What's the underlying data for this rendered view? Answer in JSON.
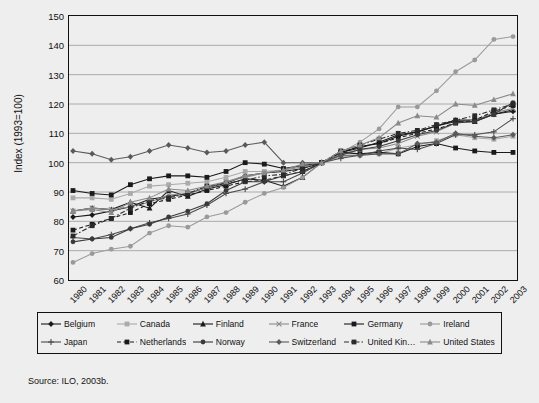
{
  "figure": {
    "source_note": "Source: ILO, 2003b.",
    "background": "#eeeeee",
    "frame_color": "#111111",
    "gridline_color": "#999999"
  },
  "axes": {
    "y_title": "Index (1993=100)",
    "y_ticks": [
      150,
      140,
      130,
      120,
      110,
      100,
      90,
      80,
      70,
      60
    ],
    "x_ticks": [
      "1980",
      "1981",
      "1982",
      "1983",
      "1984",
      "1985",
      "1986",
      "1987",
      "1988",
      "1989",
      "1990",
      "1991",
      "1992",
      "1993",
      "1994",
      "1995",
      "1996",
      "1997",
      "1998",
      "1999",
      "2000",
      "2001",
      "2002",
      "2003"
    ]
  },
  "legend": {
    "items": [
      {
        "label": "Belgium",
        "marker": "diamond",
        "dash": "solid",
        "color": "#1a1a1a"
      },
      {
        "label": "Canada",
        "marker": "square",
        "dash": "solid",
        "color": "#aaaaaa"
      },
      {
        "label": "Finland",
        "marker": "triangle",
        "dash": "solid",
        "color": "#1a1a1a"
      },
      {
        "label": "France",
        "marker": "x",
        "dash": "solid",
        "color": "#8a8a8a"
      },
      {
        "label": "Germany",
        "marker": "square",
        "dash": "solid",
        "color": "#1a1a1a"
      },
      {
        "label": "Ireland",
        "marker": "circle",
        "dash": "solid",
        "color": "#9a9a9a"
      },
      {
        "label": "Japan",
        "marker": "plus",
        "dash": "solid",
        "color": "#4a4a4a"
      },
      {
        "label": "Netherlands",
        "marker": "square",
        "dash": "dashed",
        "color": "#1a1a1a"
      },
      {
        "label": "Norway",
        "marker": "circle",
        "dash": "solid",
        "color": "#3a3a3a"
      },
      {
        "label": "Switzerland",
        "marker": "diamond",
        "dash": "solid",
        "color": "#5a5a5a"
      },
      {
        "label": "United Kingdom",
        "marker": "square",
        "dash": "dashdot",
        "color": "#2a2a2a"
      },
      {
        "label": "United States",
        "marker": "triangle",
        "dash": "solid",
        "color": "#8a8a8a"
      }
    ]
  },
  "chart_data": {
    "type": "line",
    "title": "",
    "xlabel": "",
    "ylabel": "Index (1993=100)",
    "ylim": [
      60,
      150
    ],
    "ytick_step": 10,
    "grid": "horizontal",
    "legend_position": "bottom",
    "x": [
      "1980",
      "1981",
      "1982",
      "1983",
      "1984",
      "1985",
      "1986",
      "1987",
      "1988",
      "1989",
      "1990",
      "1991",
      "1992",
      "1993",
      "1994",
      "1995",
      "1996",
      "1997",
      "1998",
      "1999",
      "2000",
      "2001",
      "2002",
      "2003"
    ],
    "series": [
      {
        "name": "Belgium",
        "values": [
          81.5,
          82.2,
          83.5,
          85.0,
          87.5,
          88.5,
          89.5,
          91.5,
          93.0,
          95.5,
          96.5,
          97.0,
          98.0,
          100,
          103.5,
          105.5,
          106.5,
          109.0,
          110.5,
          112.5,
          114.5,
          114.5,
          116.5,
          117.5
        ]
      },
      {
        "name": "Canada",
        "values": [
          88.0,
          88.0,
          87.5,
          89.5,
          92.0,
          92.5,
          93.0,
          93.5,
          95.0,
          97.0,
          97.0,
          97.5,
          99.0,
          100,
          102.0,
          102.5,
          103.0,
          105.0,
          106.0,
          107.5,
          109.5,
          108.5,
          108.0,
          109.0
        ]
      },
      {
        "name": "Finland",
        "values": [
          83.5,
          84.5,
          84.0,
          86.5,
          84.5,
          90.5,
          88.5,
          91.0,
          92.5,
          94.5,
          94.0,
          92.0,
          95.0,
          100,
          103.5,
          105.0,
          107.0,
          109.5,
          110.5,
          112.5,
          114.0,
          114.0,
          116.5,
          118.0
        ]
      },
      {
        "name": "France",
        "values": [
          83.5,
          84.5,
          84.0,
          85.0,
          86.5,
          89.0,
          89.5,
          91.5,
          93.5,
          95.0,
          96.5,
          97.5,
          98.5,
          100,
          103.0,
          104.5,
          105.0,
          106.5,
          109.0,
          110.5,
          113.5,
          114.5,
          117.0,
          118.5
        ]
      },
      {
        "name": "Germany",
        "values": [
          90.5,
          89.5,
          89.0,
          92.5,
          94.5,
          95.5,
          95.5,
          95.0,
          97.0,
          100.0,
          99.5,
          98.0,
          99.0,
          100,
          103.5,
          103.0,
          103.5,
          103.0,
          105.5,
          106.5,
          105.0,
          104.0,
          103.5,
          103.5
        ]
      },
      {
        "name": "Ireland",
        "values": [
          66.0,
          69.0,
          70.5,
          71.5,
          76.0,
          78.5,
          78.0,
          81.5,
          83.0,
          86.5,
          89.5,
          91.5,
          95.0,
          100,
          103.5,
          107.0,
          111.5,
          119.0,
          119.0,
          124.5,
          131.0,
          135.0,
          142.0,
          143.0
        ]
      },
      {
        "name": "Japan",
        "values": [
          74.5,
          74.0,
          75.5,
          77.5,
          79.5,
          81.0,
          82.5,
          85.5,
          89.5,
          91.0,
          93.5,
          93.5,
          96.5,
          100,
          101.5,
          102.5,
          104.0,
          105.0,
          104.5,
          106.5,
          109.5,
          109.5,
          110.5,
          115.0
        ]
      },
      {
        "name": "Netherlands",
        "values": [
          77.0,
          79.0,
          81.0,
          83.0,
          86.0,
          87.5,
          89.0,
          90.5,
          92.0,
          93.5,
          94.0,
          95.5,
          97.0,
          100,
          103.5,
          105.5,
          106.5,
          108.5,
          110.0,
          111.5,
          113.5,
          114.5,
          117.5,
          119.5
        ]
      },
      {
        "name": "Norway",
        "values": [
          73.0,
          74.0,
          74.5,
          77.5,
          79.0,
          81.5,
          83.5,
          86.0,
          90.5,
          93.5,
          93.5,
          95.5,
          97.0,
          100,
          102.5,
          104.5,
          105.5,
          107.5,
          109.5,
          111.0,
          113.5,
          114.0,
          116.5,
          120.5
        ]
      },
      {
        "name": "Switzerland",
        "values": [
          104.0,
          103.0,
          101.0,
          102.0,
          104.0,
          106.0,
          105.0,
          103.5,
          104.0,
          106.0,
          107.0,
          100.0,
          100.0,
          100,
          102.5,
          102.5,
          103.0,
          103.0,
          106.5,
          107.0,
          110.0,
          109.0,
          108.5,
          109.5
        ]
      },
      {
        "name": "United Kingdom",
        "values": [
          75.0,
          78.5,
          81.0,
          84.5,
          87.0,
          88.0,
          89.5,
          92.0,
          93.0,
          94.0,
          95.5,
          96.0,
          98.0,
          100,
          104.0,
          106.0,
          108.0,
          110.0,
          111.0,
          113.0,
          114.5,
          116.0,
          118.0,
          120.0
        ]
      },
      {
        "name": "United States",
        "values": [
          83.5,
          84.0,
          83.0,
          86.5,
          88.0,
          91.0,
          90.5,
          92.0,
          93.5,
          95.5,
          96.5,
          97.5,
          99.5,
          100,
          104.0,
          106.0,
          108.5,
          113.5,
          116.0,
          115.5,
          120.0,
          119.5,
          121.5,
          123.5
        ]
      }
    ]
  }
}
